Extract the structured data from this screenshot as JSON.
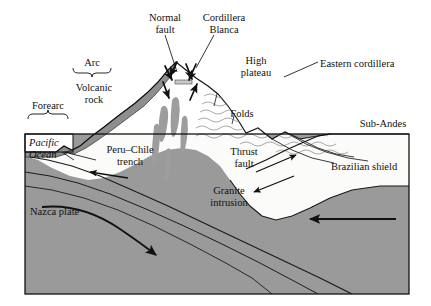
{
  "diagram": {
    "type": "geological-cross-section",
    "frame": {
      "x": 25,
      "y": 134,
      "width": 384,
      "height": 160
    }
  },
  "colors": {
    "mantle_gray": "#9a9a9a",
    "crust_white": "#fbfbfa",
    "volcanic_gray": "#8e8e8e",
    "granite_gray": "#9d9d9d",
    "fold_gray": "#8d8d8d",
    "ink": "#111111",
    "background": "#ffffff"
  },
  "labels": {
    "normal_fault": "Normal\nfault",
    "cordillera_blanca": "Cordillera\nBlanca",
    "high_plateau": "High\nplateau",
    "eastern_cordillera": "Eastern cordillera",
    "arc": "Arc",
    "volcanic_rock": "Volcanic\nrock",
    "forearc": "Forearc",
    "folds": "Folds",
    "sub_andes": "Sub-Andes",
    "pacific_ocean": "Pacific\nOcean",
    "peru_chile_trench": "Peru–Chile\ntrench",
    "thrust_fault": "Thrust\nfault",
    "granite_intrusion": "Granite\nintrusion",
    "brazilian_shield": "Brazilian shield",
    "nazca_plate": "Nazca plate"
  },
  "features": {
    "braces": [
      {
        "name": "arc-brace",
        "orientation": "down",
        "x1": 73,
        "x2": 110,
        "y": 72
      },
      {
        "name": "forearc-brace",
        "orientation": "up",
        "x1": 28,
        "x2": 68,
        "y": 113
      }
    ],
    "arrows": [
      {
        "name": "nazca-subduction-arrow",
        "direction": "down-right"
      },
      {
        "name": "convergence-arrow",
        "direction": "left"
      },
      {
        "name": "trench-arrow",
        "direction": "left"
      },
      {
        "name": "thrust-arrow-upper",
        "direction": "up-right"
      },
      {
        "name": "thrust-arrow-lower",
        "direction": "down-left"
      },
      {
        "name": "normal-fault-arrow-left-outer",
        "direction": "down-left"
      },
      {
        "name": "normal-fault-arrow-left-inner",
        "direction": "down-right"
      },
      {
        "name": "normal-fault-arrow-right-inner",
        "direction": "down-left"
      },
      {
        "name": "normal-fault-arrow-right-outer",
        "direction": "up-right"
      }
    ],
    "leaders": [
      {
        "name": "normal-fault-leader"
      },
      {
        "name": "cordillera-blanca-leader"
      },
      {
        "name": "eastern-cordillera-leader"
      },
      {
        "name": "peru-chile-trench-leader"
      }
    ],
    "granite_intrusions": 5,
    "slab_internal_lines": 2
  }
}
